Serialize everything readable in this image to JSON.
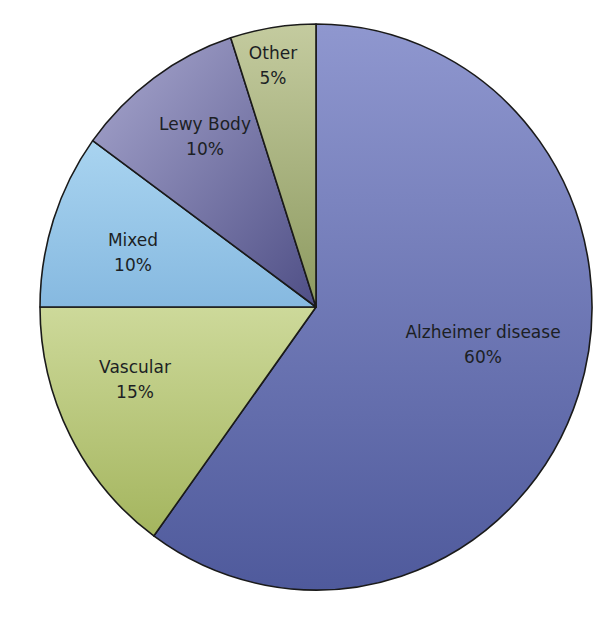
{
  "chart_data": {
    "type": "pie",
    "title": "",
    "start_angle": "12 o'clock, clockwise",
    "categories": [
      "Alzheimer disease",
      "Vascular",
      "Mixed",
      "Lewy Body",
      "Other"
    ],
    "values": [
      60,
      15,
      10,
      10,
      5
    ],
    "labels": [
      "60%",
      "15%",
      "10%",
      "10%",
      "5%"
    ],
    "colors": [
      "#5d68a6",
      "#b5c47a",
      "#93c3e6",
      "#7d7aa8",
      "#a3ad7e"
    ],
    "legend": "none (labels inside slices)"
  },
  "slices": [
    {
      "name": "Alzheimer disease",
      "pct": "60%"
    },
    {
      "name": "Vascular",
      "pct": "15%"
    },
    {
      "name": "Mixed",
      "pct": "10%"
    },
    {
      "name": "Lewy Body",
      "pct": "10%"
    },
    {
      "name": "Other",
      "pct": "5%"
    }
  ]
}
